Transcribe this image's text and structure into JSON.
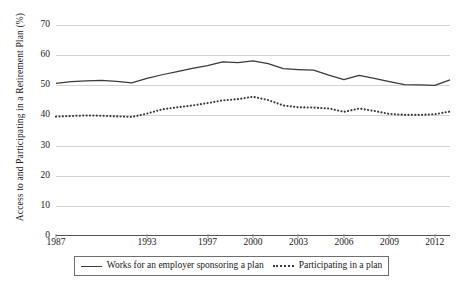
{
  "chart_data": {
    "type": "line",
    "title": "",
    "xlabel": "",
    "ylabel": "Access to and Participating in a Retirement Plan (%)",
    "ylim": [
      0,
      70
    ],
    "ytick_labels": [
      "0",
      "10",
      "20",
      "30",
      "40",
      "50",
      "60",
      "70"
    ],
    "ytick_values": [
      0,
      10,
      20,
      30,
      40,
      50,
      60,
      70
    ],
    "grid": true,
    "legend_position": "bottom",
    "x": [
      1987,
      1988,
      1989,
      1990,
      1991,
      1992,
      1993,
      1994,
      1995,
      1996,
      1997,
      1998,
      1999,
      2000,
      2001,
      2002,
      2003,
      2004,
      2005,
      2006,
      2007,
      2008,
      2009,
      2010,
      2011,
      2012,
      2013
    ],
    "xtick_labels": [
      "1987",
      "1993",
      "1997",
      "2000",
      "2003",
      "2006",
      "2009",
      "2012"
    ],
    "xtick_values": [
      1987,
      1993,
      1997,
      2000,
      2003,
      2006,
      2009,
      2012
    ],
    "series": [
      {
        "name": "Works for an employer sponsoring a plan",
        "style": "solid",
        "color": "#3b3b3b",
        "values": [
          50.6,
          51.2,
          51.5,
          51.6,
          51.3,
          50.8,
          52.3,
          53.5,
          54.5,
          55.6,
          56.5,
          57.8,
          57.5,
          58.1,
          57.2,
          55.5,
          55.2,
          55.0,
          53.4,
          51.9,
          53.3,
          52.3,
          51.2,
          50.2,
          50.1,
          50.0,
          51.8
        ]
      },
      {
        "name": "Participating in a plan",
        "style": "dotted",
        "color": "#3b3b3b",
        "values": [
          39.6,
          39.8,
          40.0,
          39.9,
          39.7,
          39.5,
          40.6,
          42.0,
          42.7,
          43.3,
          44.1,
          45.0,
          45.4,
          46.2,
          45.1,
          43.3,
          42.7,
          42.6,
          42.3,
          41.2,
          42.3,
          41.5,
          40.5,
          40.2,
          40.2,
          40.4,
          41.3
        ]
      }
    ]
  },
  "legend": {
    "entries": [
      {
        "label": "Works for an employer sponsoring a plan",
        "style": "solid"
      },
      {
        "label": "Participating in a plan",
        "style": "dotted"
      }
    ]
  }
}
